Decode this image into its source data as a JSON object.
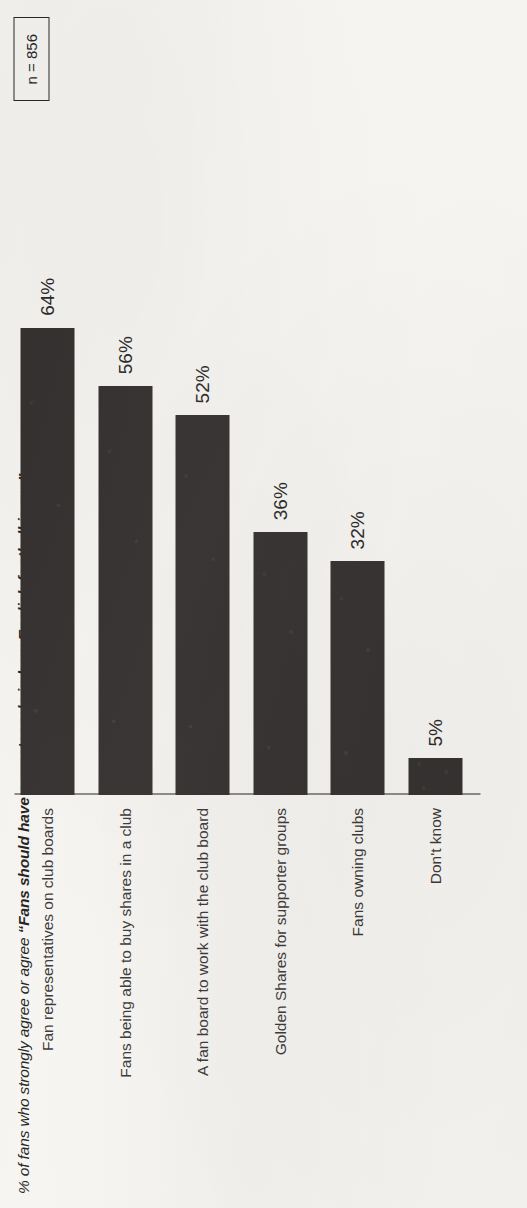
{
  "figure": {
    "title_lead": "% of fans who strongly agree or agree ",
    "title_quote": "“Fans should have a greater role in how English football is run”",
    "sample_size": "n = 856"
  },
  "chart_data": {
    "type": "bar",
    "title": "% of fans who strongly agree or agree “Fans should have a greater role in how English football is run”",
    "xlabel": "",
    "ylabel": "",
    "ylim": [
      0,
      100
    ],
    "grid": false,
    "legend": "none",
    "orientation": "vertical-bars-on-rotated-page",
    "value_suffix": "%",
    "categories": [
      "Fan representatives on club boards",
      "Fans being able to buy shares in a club",
      "A fan board to work with the club board",
      "Golden Shares for supporter groups",
      "Fans owning clubs",
      "Don't know"
    ],
    "values": [
      64,
      56,
      52,
      36,
      32,
      5
    ],
    "value_labels": [
      "64%",
      "56%",
      "52%",
      "36%",
      "32%",
      "5%"
    ],
    "bar_color": "#34302f",
    "axis_color": "#8e8b88",
    "background_color": "#f6f5f2",
    "annotations": [
      "n = 856"
    ]
  }
}
